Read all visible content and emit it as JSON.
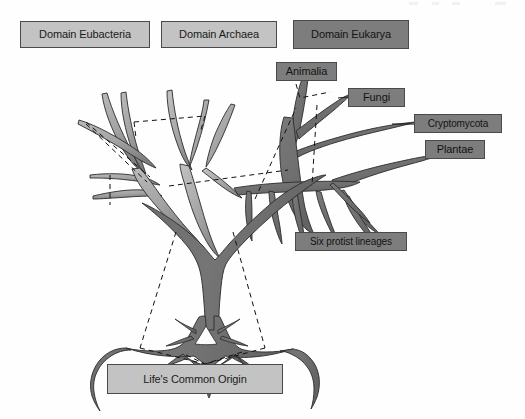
{
  "figure": {
    "kind": "phylogenetic-tree-diagram",
    "background_color": "#fefefe",
    "label_light_fill": "#c3c3c3",
    "label_dark_fill": "#7d7d7d",
    "label_border_color": "#4a4a4a",
    "branch_light_fill": "#a6a6a6",
    "branch_dark_fill": "#6e6e6e",
    "outline_color": "#2b2b2b",
    "dash_color": "#111111"
  },
  "labels": {
    "domain_eubacteria": {
      "text": "Domain Eubacteria",
      "style": "light",
      "x": 20,
      "y": 21,
      "w": 130,
      "h": 27,
      "font_size": 11
    },
    "domain_archaea": {
      "text": "Domain Archaea",
      "style": "light",
      "x": 161,
      "y": 21,
      "w": 116,
      "h": 27,
      "font_size": 11
    },
    "domain_eukarya": {
      "text": "Domain Eukarya",
      "style": "dark",
      "x": 293,
      "y": 20,
      "w": 116,
      "h": 29,
      "font_size": 11
    },
    "animalia": {
      "text": "Animalia",
      "style": "dark",
      "x": 276,
      "y": 62,
      "w": 61,
      "h": 19,
      "font_size": 11
    },
    "fungi": {
      "text": "Fungi",
      "style": "dark",
      "x": 348,
      "y": 88,
      "w": 57,
      "h": 19,
      "font_size": 11
    },
    "cryptomycota": {
      "text": "Cryptomycota",
      "style": "dark",
      "x": 414,
      "y": 114,
      "w": 88,
      "h": 19,
      "font_size": 10
    },
    "plantae": {
      "text": "Plantae",
      "style": "dark",
      "x": 425,
      "y": 140,
      "w": 60,
      "h": 19,
      "font_size": 11
    },
    "six_protist_lineages": {
      "text": "Six protist lineages",
      "style": "dark",
      "x": 295,
      "y": 232,
      "w": 112,
      "h": 19,
      "font_size": 10
    },
    "lifes_common_origin": {
      "text": "Life's Common Origin",
      "style": "light",
      "x": 107,
      "y": 364,
      "w": 176,
      "h": 30,
      "font_size": 11
    }
  },
  "leader_lines": [
    {
      "name": "cryptomycota-leader",
      "from": [
        414,
        124
      ],
      "to": [
        330,
        124
      ]
    },
    {
      "name": "fungi-leader",
      "from": [
        348,
        97
      ],
      "to": [
        300,
        100
      ]
    }
  ],
  "dashed_brackets": [
    {
      "name": "eubacteria-bracket"
    },
    {
      "name": "archaea-bracket"
    },
    {
      "name": "eukarya-bracket"
    },
    {
      "name": "animalia-bracket"
    },
    {
      "name": "fungi-bracket"
    },
    {
      "name": "origin-bracket"
    }
  ]
}
